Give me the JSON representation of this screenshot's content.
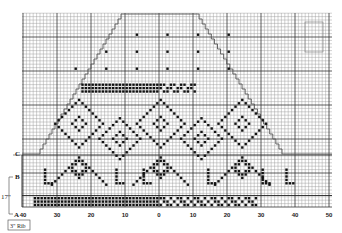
{
  "chart_data": {
    "type": "knitting-chart",
    "grid": {
      "stitch_px": 3.4,
      "row_px": 3.4,
      "origin_x": 159,
      "left": 22,
      "right": 332,
      "top": 13,
      "bottom": 207,
      "major_every": 10
    },
    "x_tick_labels": [
      {
        "label": "40",
        "value": -40
      },
      {
        "label": "30",
        "value": -30
      },
      {
        "label": "20",
        "value": -20
      },
      {
        "label": "10",
        "value": -10
      },
      {
        "label": "0",
        "value": 0
      },
      {
        "label": "10",
        "value": 10
      },
      {
        "label": "20",
        "value": 20
      },
      {
        "label": "30",
        "value": 30
      },
      {
        "label": "40",
        "value": 40
      },
      {
        "label": "50",
        "value": 50
      }
    ],
    "side_markers": [
      {
        "label": "C",
        "y": 152
      },
      {
        "label": "B",
        "y": 175
      },
      {
        "label": "A",
        "y": 214
      }
    ],
    "measurements": [
      {
        "label": "17\"",
        "from": "A",
        "to": "B"
      },
      {
        "label": "3\" Rib",
        "below": "A"
      }
    ],
    "outline": {
      "top_left_x": 124,
      "top_right_x": 196,
      "top_y": 14,
      "bottom_left_x": 40,
      "bottom_right_x": 282,
      "bottom_y": 154
    },
    "bands": [
      {
        "name": "scattered-x-rows",
        "rows_y": [
          33,
          50,
          67
        ],
        "style": "sparse-x"
      },
      {
        "name": "zigzag-band",
        "y_top": 83,
        "y_bottom": 92,
        "style": "dense-x"
      },
      {
        "name": "diamond-motif-band",
        "y_top": 100,
        "y_bottom": 192,
        "style": "diamonds"
      },
      {
        "name": "hem-band",
        "y_top": 196,
        "y_bottom": 207,
        "style": "dense-x"
      }
    ],
    "legend_box": {
      "x": 305,
      "y": 22,
      "w": 18,
      "h": 30
    }
  }
}
